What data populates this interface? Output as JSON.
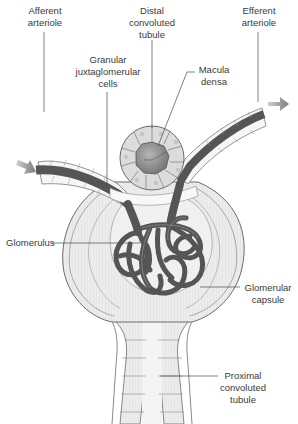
{
  "diagram": {
    "colors": {
      "vessel": "#5a5a5a",
      "vessel_dark": "#4a4a4a",
      "capsule_fill": "#e8e8e8",
      "cell_fill": "#f3f3f3",
      "tubule_cell": "#dcdcdc",
      "macula_center": "#8a8a8a",
      "outline": "#6b6b6b",
      "arrow": "#8c8c8c",
      "text": "#3a3a3a"
    },
    "labels": {
      "afferent_arteriole": {
        "line1": "Afferent",
        "line2": "arteriole"
      },
      "distal_convoluted_tubule": {
        "line1": "Distal",
        "line2": "convoluted",
        "line3": "tubule"
      },
      "efferent_arteriole": {
        "line1": "Efferent",
        "line2": "arteriole"
      },
      "granular_juxtaglomerular_cells": {
        "line1": "Granular",
        "line2": "juxtaglomerular",
        "line3": "cells"
      },
      "macula_densa": {
        "line1": "Macula",
        "line2": "densa"
      },
      "glomerulus": {
        "line1": "Glomerulus"
      },
      "glomerular_capsule": {
        "line1": "Glomerular",
        "line2": "capsule"
      },
      "proximal_convoluted_tubule": {
        "line1": "Proximal",
        "line2": "convoluted",
        "line3": "tubule"
      }
    },
    "arrows": [
      {
        "name": "inflow-arrow",
        "direction": "down-right"
      },
      {
        "name": "outflow-arrow",
        "direction": "right"
      }
    ]
  }
}
